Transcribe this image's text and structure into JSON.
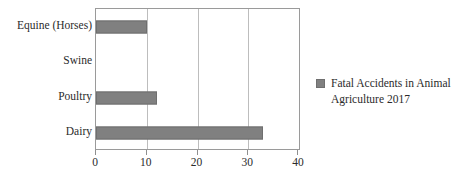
{
  "chart_data": {
    "type": "bar",
    "orientation": "horizontal",
    "title": "",
    "xlabel": "",
    "ylabel": "",
    "categories": [
      "Equine (Horses)",
      "Swine",
      "Poultry",
      "Dairy"
    ],
    "values": [
      10,
      0,
      12,
      33
    ],
    "series": [
      {
        "name": "Fatal Accidents in Animal Agriculture 2017",
        "values": [
          10,
          0,
          12,
          33
        ],
        "color": "#808080"
      }
    ],
    "xlim": [
      0,
      40
    ],
    "xticks": [
      0,
      10,
      20,
      30,
      40
    ],
    "xtick_labels": [
      "0",
      "10",
      "20",
      "30",
      "40"
    ],
    "gridlines": [
      10,
      20,
      30
    ],
    "grid": true,
    "legend": {
      "position": "right",
      "entries": [
        {
          "label_line1": "Fatal Accidents in Animal",
          "label_line2": "Agriculture 2017",
          "full_label": "Fatal Accidents in Animal Agriculture 2017",
          "color": "#808080"
        }
      ]
    }
  },
  "colors": {
    "bar": "#808080",
    "bar_border": "#6f6f6f",
    "gridline": "#bdbdbd",
    "frame": "#9a9a9a",
    "text": "#2b2b2b",
    "background": "#ffffff"
  }
}
